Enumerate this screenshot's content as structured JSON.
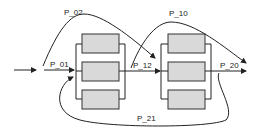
{
  "diagram": {
    "type": "process flow with two parallel stages",
    "labels": {
      "p01": "P_01",
      "p02": "P_02",
      "p10": "P_10",
      "p12": "P_12",
      "p20": "P_20",
      "p21": "P_21"
    },
    "stages": [
      {
        "name": "stage-1",
        "parallel_units": 3
      },
      {
        "name": "stage-2",
        "parallel_units": 3
      }
    ],
    "colors": {
      "box_fill": "#d9d9d9",
      "line": "#222222",
      "background": "#ffffff"
    }
  }
}
